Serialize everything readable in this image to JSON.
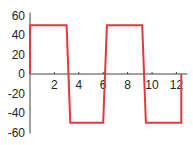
{
  "chart_data": {
    "type": "line",
    "title": "",
    "xlabel": "",
    "ylabel": "",
    "xlim": [
      0,
      12.9
    ],
    "ylim": [
      -60,
      60
    ],
    "grid": false,
    "legend": null,
    "x_ticks": [
      2,
      4,
      6,
      8,
      10,
      12
    ],
    "x_tick_labels": [
      "2",
      "4",
      "6",
      "8",
      "10",
      "12"
    ],
    "y_ticks": [
      60,
      40,
      20,
      0,
      -20,
      -40,
      -60
    ],
    "y_tick_labels": [
      "60",
      "40",
      "20",
      "0",
      "-20",
      "-40",
      "-60"
    ],
    "series": [
      {
        "name": "square wave",
        "color": "#e0393e",
        "x": [
          0,
          0,
          3.0,
          3.3,
          6.0,
          6.3,
          9.2,
          9.5,
          12.4,
          12.4
        ],
        "y": [
          0,
          50,
          50,
          -50,
          -50,
          50,
          50,
          -50,
          -50,
          0
        ]
      }
    ]
  },
  "colors": {
    "line": "#e0393e",
    "axis": "#444444",
    "text": "#222222"
  }
}
